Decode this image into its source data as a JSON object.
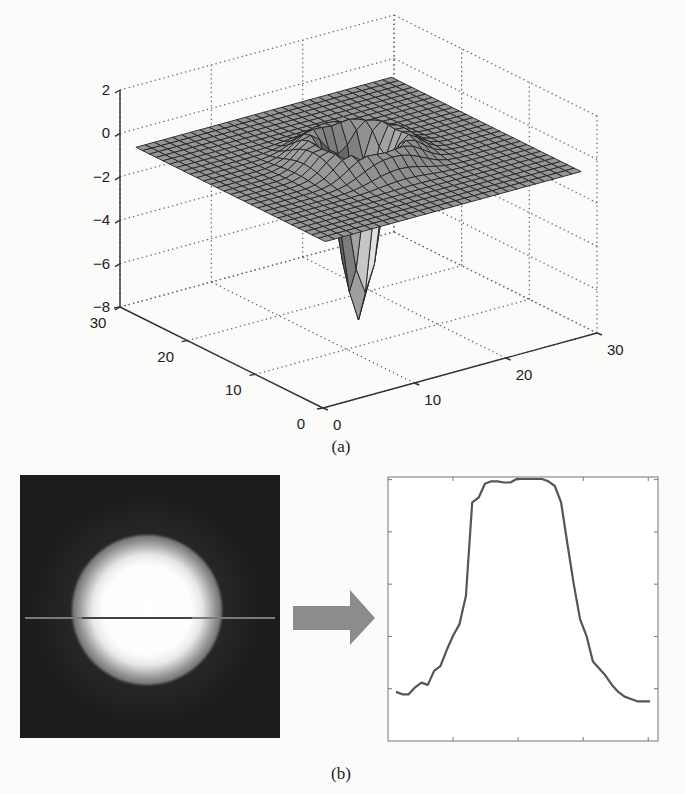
{
  "captions": {
    "a": "(a)",
    "b": "(b)"
  },
  "colors": {
    "edge": "#222222",
    "face_base": "#9a9a9a",
    "grid": "#555555",
    "arrow": "#8c8c8c",
    "profile_line": "#555555",
    "box": "#777777"
  },
  "chart_data": [
    {
      "type": "surface",
      "title": "",
      "description": "3D mesh surface of an inverted Mexican-hat (Laplacian-of-Gaussian) kernel: flat plane near 0, a raised ring around the center and a sharp negative spike to about -8 at the center",
      "x": {
        "range": [
          0,
          30
        ],
        "ticks": [
          0,
          10,
          20,
          30
        ]
      },
      "y": {
        "range": [
          0,
          30
        ],
        "ticks": [
          0,
          10,
          20,
          30
        ]
      },
      "z": {
        "range": [
          -8,
          2
        ],
        "ticks": [
          2,
          0,
          -2,
          -4,
          -6,
          -8
        ]
      },
      "grid_n": 29,
      "grid_start": 1,
      "grid_end": 29,
      "center": [
        15,
        15
      ],
      "baseline_z": -0.6,
      "min_z": -8,
      "sigma": 2.2,
      "grid": true
    },
    {
      "type": "image",
      "description": "Grayscale image of a bright roughly circular blob on dark background with a horizontal scan line through its center"
    },
    {
      "type": "line",
      "title": "",
      "description": "Intensity profile along the scan line: low plateau, steep rise, flat top plateau, steep fall, low plateau",
      "x": [
        0,
        1,
        2,
        3,
        4,
        5,
        6,
        7,
        8,
        9,
        10,
        11,
        12,
        13,
        14,
        15,
        16,
        17,
        18,
        19,
        20,
        21,
        22,
        23,
        24,
        25,
        26,
        27,
        28,
        29,
        30,
        31,
        32,
        33,
        34,
        35,
        36,
        37,
        38,
        39,
        40
      ],
      "values": [
        0.09,
        0.08,
        0.08,
        0.11,
        0.13,
        0.12,
        0.18,
        0.2,
        0.27,
        0.33,
        0.38,
        0.5,
        0.9,
        0.92,
        0.98,
        0.99,
        0.99,
        0.985,
        0.985,
        1.0,
        1.0,
        1.0,
        1.0,
        1.0,
        0.99,
        0.97,
        0.9,
        0.72,
        0.55,
        0.4,
        0.33,
        0.22,
        0.19,
        0.16,
        0.12,
        0.09,
        0.07,
        0.06,
        0.05,
        0.05,
        0.05
      ],
      "xticks": 5,
      "yticks": 6,
      "axis_labels_visible": false,
      "grid": false
    }
  ]
}
